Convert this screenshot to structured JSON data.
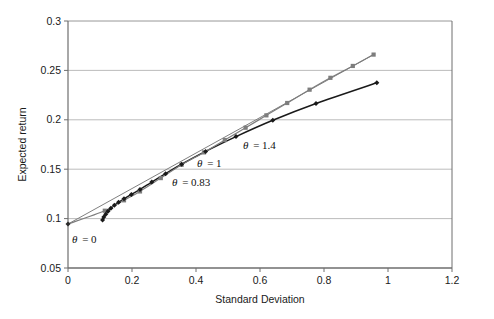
{
  "chart_data": {
    "type": "line",
    "title": "",
    "xlabel": "Standard Deviation",
    "ylabel": "Expected return",
    "xlim": [
      0,
      1.2
    ],
    "ylim": [
      0.05,
      0.3
    ],
    "xticks": [
      "0",
      "0.2",
      "0.4",
      "0.6",
      "0.8",
      "1",
      "1.2"
    ],
    "xtick_values": [
      0,
      0.2,
      0.4,
      0.6,
      0.8,
      1.0,
      1.2
    ],
    "yticks": [
      "0.05",
      "0.1",
      "0.15",
      "0.2",
      "0.25",
      "0.3"
    ],
    "ytick_values": [
      0.05,
      0.1,
      0.15,
      0.2,
      0.25,
      0.3
    ],
    "grid": "horizontal",
    "legend_position": "inline-annotations",
    "colors": {
      "upper_series": "#7d7d7d",
      "lower_series": "#1a1a1a",
      "straight_line": "#808080",
      "grid": "#b4b4b4",
      "axis": "#6e6e6e",
      "text": "#1a1a1a"
    },
    "series": [
      {
        "name": "efficient-frontier-upper",
        "marker": "square",
        "color": "#7d7d7d",
        "x": [
          0.0,
          0.115,
          0.175,
          0.225,
          0.29,
          0.355,
          0.425,
          0.49,
          0.555,
          0.62,
          0.685,
          0.755,
          0.82,
          0.89,
          0.955
        ],
        "y": [
          0.0945,
          0.108,
          0.1185,
          0.1275,
          0.141,
          0.1545,
          0.167,
          0.1795,
          0.192,
          0.2045,
          0.217,
          0.2305,
          0.2425,
          0.2545,
          0.266
        ]
      },
      {
        "name": "constrained-frontier-lower",
        "marker": "diamond",
        "color": "#1a1a1a",
        "x": [
          0.108,
          0.112,
          0.118,
          0.125,
          0.134,
          0.145,
          0.158,
          0.175,
          0.198,
          0.225,
          0.262,
          0.305,
          0.355,
          0.43,
          0.525,
          0.64,
          0.775,
          0.965
        ],
        "y": [
          0.0985,
          0.1015,
          0.1045,
          0.1075,
          0.1105,
          0.1135,
          0.1165,
          0.12,
          0.1245,
          0.1295,
          0.137,
          0.1455,
          0.155,
          0.168,
          0.183,
          0.1995,
          0.2165,
          0.2375
        ]
      },
      {
        "name": "capital-market-line",
        "marker": "none",
        "color": "#808080",
        "x": [
          0.0,
          0.955
        ],
        "y": [
          0.0945,
          0.266
        ]
      }
    ],
    "annotations": [
      {
        "name": "theta-0",
        "text": "θ = 0",
        "symbol": "θ",
        "value": "0",
        "x_px": 72,
        "y_px": 243
      },
      {
        "name": "theta-083",
        "text": "θ = 0.83",
        "symbol": "θ",
        "value": "0.83",
        "x_px": 172,
        "y_px": 186
      },
      {
        "name": "theta-1",
        "text": "θ = 1",
        "symbol": "θ",
        "value": "1",
        "x_px": 197,
        "y_px": 167
      },
      {
        "name": "theta-14",
        "text": "θ = 1.4",
        "symbol": "θ",
        "value": "1.4",
        "x_px": 243,
        "y_px": 149
      }
    ]
  }
}
